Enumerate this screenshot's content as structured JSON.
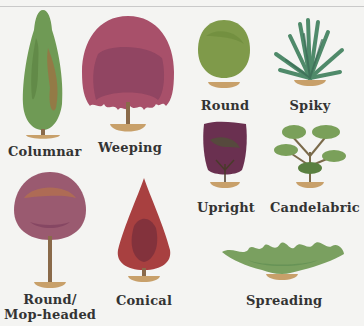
{
  "colors": {
    "background": "#f4f4f2",
    "base": "#c8a06a",
    "trunk": "#8a6a4a"
  },
  "shapes": [
    {
      "id": "columnar",
      "label": "Columnar",
      "color": "#6f9a55",
      "accent": "#b0603a"
    },
    {
      "id": "weeping",
      "label": "Weeping",
      "color": "#a8506a",
      "accent": "#7a3a5a"
    },
    {
      "id": "round",
      "label": "Round",
      "color": "#7f9a4a",
      "accent": "#6a8a3a"
    },
    {
      "id": "spiky",
      "label": "Spiky",
      "color": "#4f8a6a",
      "accent": "#3a6a55"
    },
    {
      "id": "upright",
      "label": "Upright",
      "color": "#6a3050",
      "accent": "#4a5a30"
    },
    {
      "id": "candelabric",
      "label": "Candelabric",
      "color": "#7aa05a",
      "accent": "#5a8040"
    },
    {
      "id": "round-mop-headed",
      "label_line1": "Round/",
      "label_line2": "Mop-headed",
      "color": "#9a5a70",
      "accent": "#c07a40"
    },
    {
      "id": "conical",
      "label": "Conical",
      "color": "#a84040",
      "accent": "#6a2a3a"
    },
    {
      "id": "spreading",
      "label": "Spreading",
      "color": "#7aa060",
      "accent": "#5a8a50"
    }
  ]
}
